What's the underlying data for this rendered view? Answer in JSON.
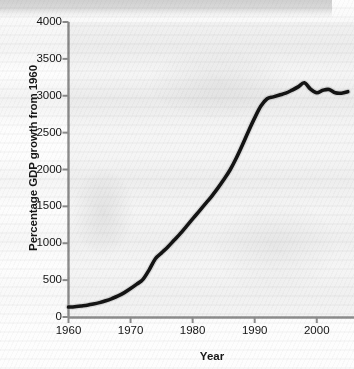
{
  "figure": {
    "kind": "scanned-line-chart",
    "background_color": "#fdfdfd",
    "line_color": "#141414",
    "axis_color": "#8c8c8c",
    "text_color": "#141414"
  },
  "chart_data": {
    "type": "line",
    "title": "",
    "xlabel": "Year",
    "ylabel": "Percentage GDP growth from 1960",
    "xlim": [
      1960,
      2006
    ],
    "ylim": [
      0,
      4000
    ],
    "xticks": [
      1960,
      1970,
      1980,
      1990,
      2000
    ],
    "yticks": [
      0,
      500,
      1000,
      1500,
      2000,
      2500,
      3000,
      3500,
      4000
    ],
    "xtick_labels": [
      "1960",
      "1970",
      "1980",
      "1990",
      "2000"
    ],
    "ytick_labels": [
      "0",
      "500",
      "1000",
      "1500",
      "2000",
      "2500",
      "3000",
      "3500",
      "4000"
    ],
    "grid": false,
    "legend": "none",
    "series": [
      {
        "name": "Percentage GDP growth from 1960",
        "x": [
          1960,
          1961,
          1962,
          1963,
          1964,
          1965,
          1966,
          1967,
          1968,
          1969,
          1970,
          1971,
          1972,
          1973,
          1974,
          1975,
          1976,
          1977,
          1978,
          1979,
          1980,
          1981,
          1982,
          1983,
          1984,
          1985,
          1986,
          1987,
          1988,
          1989,
          1990,
          1991,
          1992,
          1993,
          1994,
          1995,
          1996,
          1997,
          1998,
          1999,
          2000,
          2001,
          2002,
          2003,
          2004,
          2005
        ],
        "values": [
          135,
          140,
          150,
          160,
          175,
          195,
          220,
          250,
          285,
          330,
          385,
          445,
          510,
          640,
          790,
          870,
          950,
          1040,
          1130,
          1230,
          1330,
          1430,
          1530,
          1630,
          1740,
          1860,
          1990,
          2150,
          2330,
          2520,
          2700,
          2860,
          2960,
          2985,
          3010,
          3035,
          3075,
          3120,
          3175,
          3090,
          3040,
          3075,
          3085,
          3040,
          3035,
          3055
        ]
      }
    ]
  }
}
